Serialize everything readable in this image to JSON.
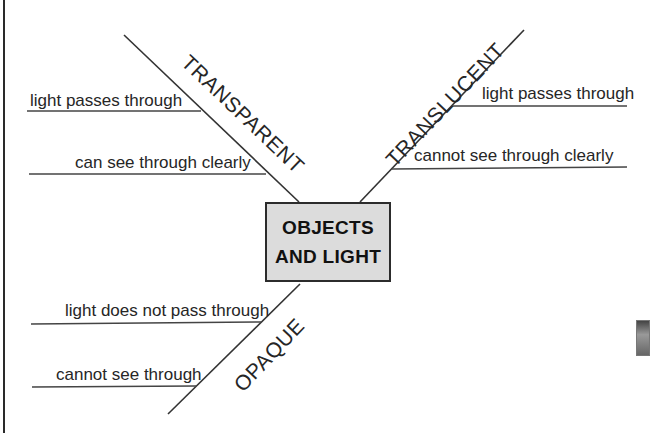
{
  "diagram": {
    "title_line1": "OBJECTS",
    "title_line2": "AND LIGHT",
    "branches": {
      "transparent": {
        "label": "TRANSPARENT",
        "details": [
          "light passes through",
          "can see through clearly"
        ]
      },
      "translucent": {
        "label": "TRANSLUCENT",
        "details": [
          "light passes through",
          "cannot see through clearly"
        ]
      },
      "opaque": {
        "label": "OPAQUE",
        "details": [
          "light does not pass through",
          "cannot see through"
        ]
      }
    },
    "colors": {
      "line": "#333333",
      "box_fill": "#dcdcdc",
      "text": "#262626"
    }
  }
}
